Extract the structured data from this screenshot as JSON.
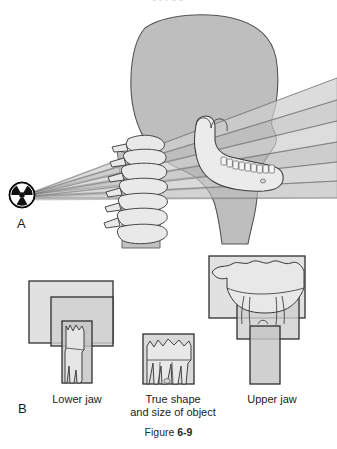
{
  "figure": {
    "caption_word": "Figure",
    "caption_number": "6-9",
    "top_cropped_text": "g  p y     g  g"
  },
  "panels": {
    "a": {
      "letter": "A",
      "source_icon": "radiation-trefoil-icon",
      "description": "Lateral head and neck with x-ray beam bands from radiation source"
    },
    "b": {
      "letter": "B",
      "groups": [
        {
          "label": "Lower jaw"
        },
        {
          "label": "True shape\nand size of object"
        },
        {
          "label": "Upper jaw"
        }
      ]
    }
  },
  "colors": {
    "beam_band_light": "#d7d7d7",
    "beam_band_mid": "#c4c4c4",
    "beam_band_dark": "#b2b2b2",
    "head_fill": "#bebebe",
    "bone_fill": "#e8e8e8",
    "outline": "#4a4a4a",
    "source_fill": "#111111",
    "source_symbol": "#ffffff",
    "box_fill": "#d2d2d2",
    "box_stroke": "#2e2e2e",
    "background": "#ffffff"
  }
}
